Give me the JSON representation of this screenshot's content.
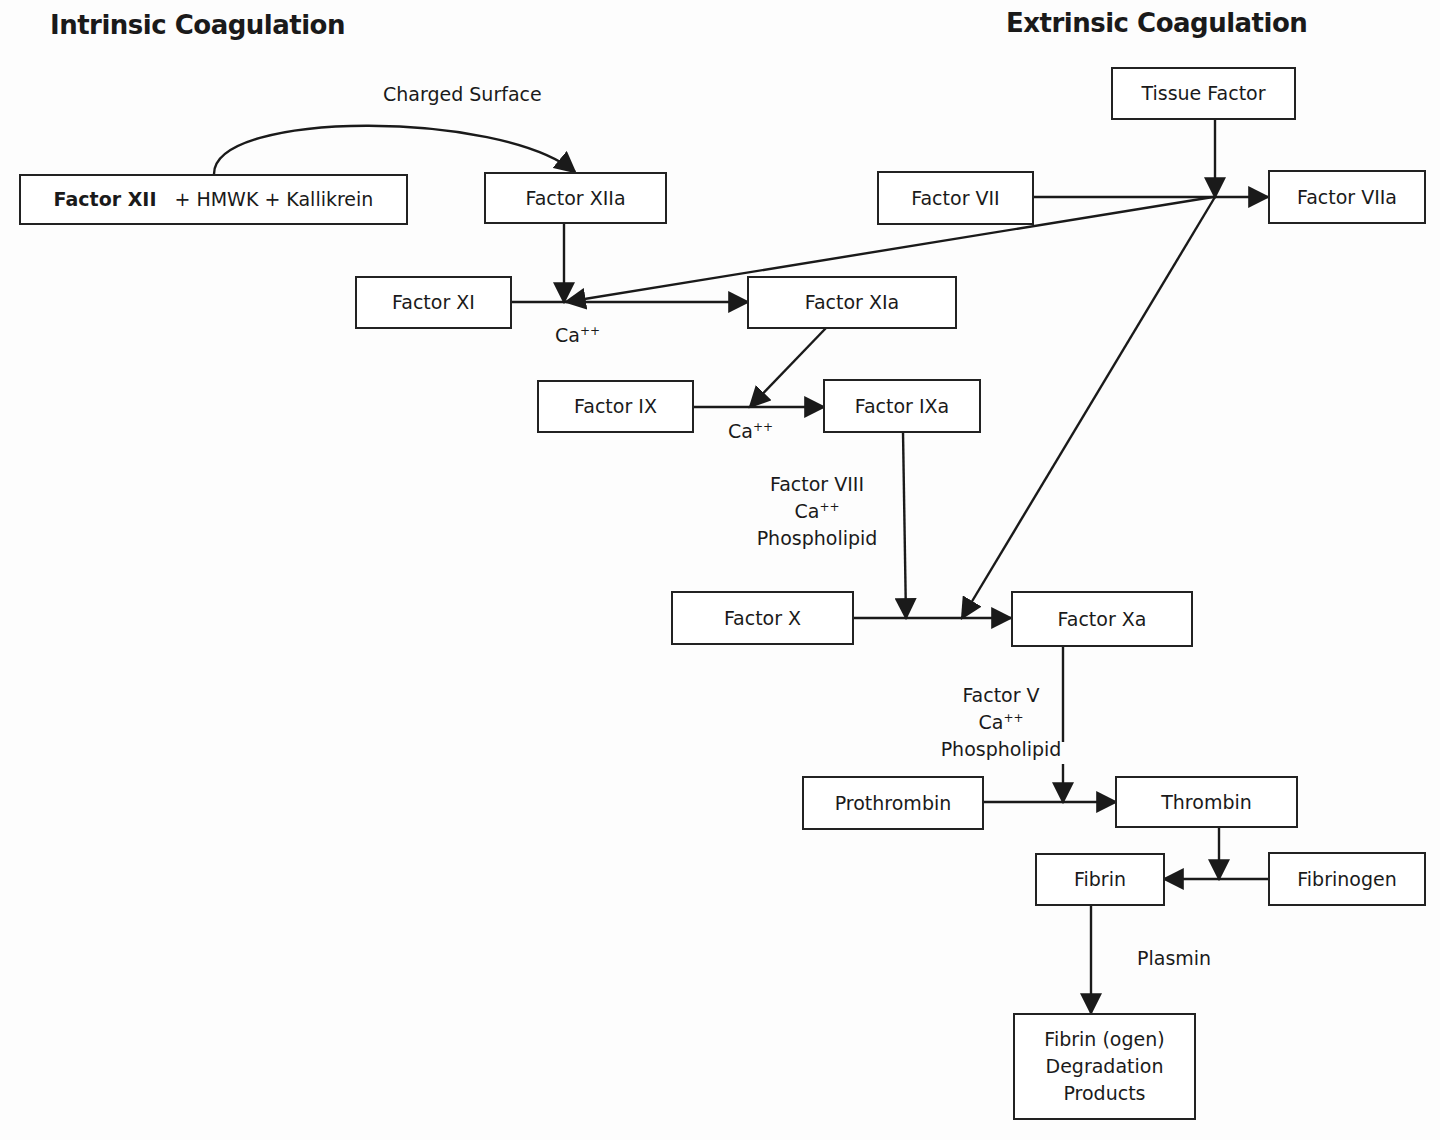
{
  "titles": {
    "intrinsic": "Intrinsic Coagulation",
    "extrinsic": "Extrinsic Coagulation"
  },
  "nodes": {
    "factor_xii": {
      "bold": "Factor XII",
      "rest": "+ HMWK + Kallikrein"
    },
    "factor_xiia": "Factor XIIa",
    "tissue_factor": "Tissue Factor",
    "factor_vii": "Factor VII",
    "factor_viia": "Factor VIIa",
    "factor_xi": "Factor XI",
    "factor_xia": "Factor XIa",
    "factor_ix": "Factor IX",
    "factor_ixa": "Factor IXa",
    "factor_x": "Factor X",
    "factor_xa": "Factor Xa",
    "prothrombin": "Prothrombin",
    "thrombin": "Thrombin",
    "fibrin": "Fibrin",
    "fibrinogen": "Fibrinogen",
    "fdp": {
      "line1": "Fibrin (ogen)",
      "line2": "Degradation",
      "line3": "Products"
    }
  },
  "labels": {
    "charged_surface": "Charged Surface",
    "ca_xi": {
      "base": "Ca",
      "sup": "++"
    },
    "ca_ix": {
      "base": "Ca",
      "sup": "++"
    },
    "cofactors_x": {
      "line1": "Factor VIII",
      "ca_base": "Ca",
      "ca_sup": "++",
      "line3": "Phospholipid"
    },
    "cofactors_prothrombin": {
      "line1": "Factor V",
      "ca_base": "Ca",
      "ca_sup": "++",
      "line3": "Phospholipid"
    },
    "plasmin": "Plasmin"
  },
  "edges": [
    {
      "from": "factor_xii",
      "to": "factor_xiia",
      "via": "charged_surface"
    },
    {
      "from": "factor_xiia",
      "to": "factor_xi_reaction"
    },
    {
      "from": "tissue_factor",
      "to": "factor_vii_reaction"
    },
    {
      "from": "factor_vii",
      "to": "factor_viia"
    },
    {
      "from": "factor_viia_complex",
      "to": "factor_xi_reaction"
    },
    {
      "from": "factor_viia_complex",
      "to": "factor_x_reaction"
    },
    {
      "from": "factor_xi",
      "to": "factor_xia",
      "via": "Ca++"
    },
    {
      "from": "factor_xia",
      "to": "factor_ix_reaction"
    },
    {
      "from": "factor_ix",
      "to": "factor_ixa",
      "via": "Ca++"
    },
    {
      "from": "factor_ixa",
      "to": "factor_x_reaction",
      "via": "Factor VIII, Ca++, Phospholipid"
    },
    {
      "from": "factor_x",
      "to": "factor_xa"
    },
    {
      "from": "factor_xa",
      "to": "prothrombin_reaction",
      "via": "Factor V, Ca++, Phospholipid"
    },
    {
      "from": "prothrombin",
      "to": "thrombin"
    },
    {
      "from": "thrombin",
      "to": "fibrinogen_reaction"
    },
    {
      "from": "fibrinogen",
      "to": "fibrin"
    },
    {
      "from": "fibrin",
      "to": "fdp",
      "via": "Plasmin"
    }
  ]
}
